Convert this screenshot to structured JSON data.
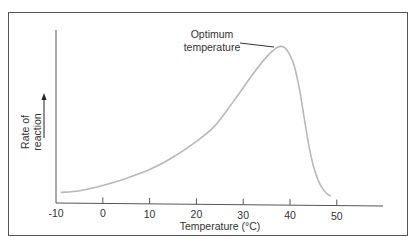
{
  "chart_data": {
    "type": "line",
    "title": "",
    "xlabel": "Temperature (°C)",
    "ylabel": "Rate of reaction",
    "ylabel_lines": [
      "Rate of",
      "reaction"
    ],
    "ylabel_arrow": true,
    "x_ticks": [
      -10,
      0,
      10,
      20,
      30,
      40,
      50
    ],
    "x_tick_labels": [
      "-10",
      "0",
      "10",
      "20",
      "30",
      "40",
      "50"
    ],
    "xlim": [
      -10,
      58
    ],
    "ylim": [
      0,
      100
    ],
    "y_ticks": [],
    "grid": false,
    "legend": null,
    "series": [
      {
        "name": "Rate of reaction",
        "color": "#b9b9b9",
        "x": [
          -9,
          -5,
          0,
          5,
          10,
          15,
          20,
          24,
          28,
          32,
          35,
          37,
          38,
          39,
          40,
          41,
          42,
          43,
          44,
          45,
          46,
          47,
          48,
          48.7
        ],
        "y": [
          6,
          7,
          10,
          14,
          19,
          26,
          35,
          44,
          58,
          73,
          83,
          88,
          89,
          88,
          84,
          77,
          65,
          49,
          33,
          21,
          13,
          8,
          5,
          4
        ]
      }
    ],
    "annotations": [
      {
        "text_lines": [
          "Optimum",
          "temperature"
        ],
        "points_to": {
          "x": 37,
          "y": 88
        },
        "label": "Optimum temperature"
      }
    ]
  },
  "labels": {
    "x_axis_title": "Temperature (°C)",
    "y_axis_line1": "Rate of",
    "y_axis_line2": "reaction",
    "annotation_line1": "Optimum",
    "annotation_line2": "temperature",
    "ticks": [
      "-10",
      "0",
      "10",
      "20",
      "30",
      "40",
      "50"
    ]
  },
  "colors": {
    "curve": "#b9b9b9",
    "axes": "#555555",
    "text": "#333333",
    "background": "#ffffff"
  }
}
